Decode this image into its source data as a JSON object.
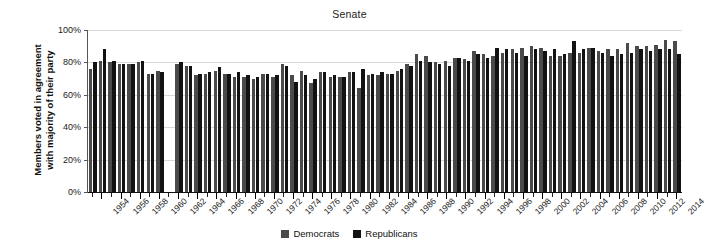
{
  "chart_data": {
    "type": "bar",
    "title": "Senate",
    "xlabel": "",
    "ylabel_lines": [
      "Members voted in agreement",
      "with majority of their party"
    ],
    "ylabel": "Members voted in agreement with majority of their party",
    "ylim": [
      0,
      100
    ],
    "ytick_labels": [
      "0%",
      "20%",
      "40%",
      "60%",
      "80%",
      "100%"
    ],
    "ytick_values": [
      0,
      20,
      40,
      60,
      80,
      100
    ],
    "grid": true,
    "legend_position": "bottom-center",
    "legend": [
      "Democrats",
      "Republicans"
    ],
    "colors": {
      "Democrats": "#4a4a4a",
      "Republicans": "#121212"
    },
    "x_tick_label_years": [
      1954,
      1956,
      1958,
      1960,
      1962,
      1964,
      1966,
      1968,
      1970,
      1972,
      1974,
      1976,
      1978,
      1980,
      1982,
      1984,
      1986,
      1988,
      1990,
      1992,
      1994,
      1996,
      1998,
      2000,
      2002,
      2004,
      2006,
      2008,
      2010,
      2012,
      2014
    ],
    "x": [
      1953,
      1954,
      1955,
      1956,
      1957,
      1958,
      1959,
      1960,
      1961,
      1962,
      1963,
      1964,
      1965,
      1966,
      1967,
      1968,
      1969,
      1970,
      1971,
      1972,
      1973,
      1974,
      1975,
      1976,
      1977,
      1978,
      1979,
      1980,
      1981,
      1982,
      1983,
      1984,
      1985,
      1986,
      1987,
      1988,
      1989,
      1990,
      1991,
      1992,
      1993,
      1994,
      1995,
      1996,
      1997,
      1998,
      1999,
      2000,
      2001,
      2002,
      2003,
      2004,
      2005,
      2006,
      2007,
      2008,
      2009,
      2010,
      2011,
      2012,
      2013,
      2014
    ],
    "series": [
      {
        "name": "Democrats",
        "values": [
          76,
          81,
          80,
          79,
          79,
          80,
          73,
          75,
          null,
          79,
          78,
          72,
          73,
          75,
          73,
          71,
          71,
          70,
          73,
          71,
          79,
          72,
          75,
          67,
          74,
          71,
          71,
          74,
          64,
          72,
          72,
          73,
          75,
          79,
          85,
          84,
          80,
          81,
          83,
          82,
          87,
          85,
          84,
          86,
          88,
          89,
          90,
          89,
          84,
          84,
          86,
          86,
          89,
          87,
          88,
          88,
          92,
          90,
          90,
          91,
          94,
          93
        ],
        "values_note": "party unity score percent; 1961 not shown"
      },
      {
        "name": "Republicans",
        "values": [
          80,
          88,
          81,
          79,
          79,
          81,
          73,
          74,
          null,
          80,
          78,
          73,
          74,
          77,
          73,
          74,
          72,
          71,
          73,
          72,
          78,
          68,
          72,
          70,
          74,
          72,
          71,
          74,
          76,
          73,
          74,
          73,
          76,
          78,
          81,
          80,
          79,
          78,
          83,
          81,
          85,
          83,
          89,
          88,
          86,
          84,
          88,
          87,
          88,
          85,
          93,
          88,
          89,
          86,
          84,
          85,
          86,
          88,
          87,
          88,
          88,
          85
        ],
        "values_note": "party unity score percent; 1961 not shown"
      }
    ]
  }
}
